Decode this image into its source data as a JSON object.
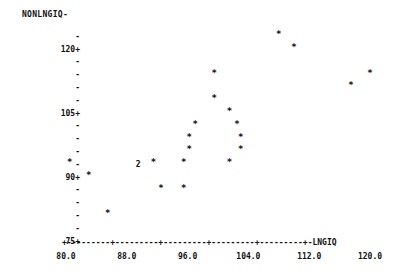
{
  "chart_data": {
    "type": "scatter",
    "title": "",
    "xlabel": "LNGIQ",
    "ylabel": "NONLNGIQ",
    "xlim": [
      78.0,
      124.0
    ],
    "ylim": [
      75,
      126
    ],
    "xticks": [
      "80.0",
      "88.0",
      "96.0",
      "104.0",
      "112.0",
      "120.0"
    ],
    "xtick_values": [
      80.0,
      88.0,
      96.0,
      104.0,
      120.0
    ],
    "yticks": [
      "120+",
      "105+",
      "90+",
      "75+"
    ],
    "ytick_values": [
      120,
      105,
      90,
      75
    ],
    "ytick_minor": "-",
    "grid": false,
    "legend": null,
    "marker": "*",
    "overlap_marker": "2",
    "points": [
      {
        "x": 80.5,
        "y": 93,
        "label": "*",
        "count": 1
      },
      {
        "x": 83.0,
        "y": 90,
        "label": "*",
        "count": 1
      },
      {
        "x": 85.5,
        "y": 81,
        "label": "*",
        "count": 1
      },
      {
        "x": 89.5,
        "y": 93,
        "label": "2",
        "count": 2
      },
      {
        "x": 91.5,
        "y": 93,
        "label": "*",
        "count": 1
      },
      {
        "x": 92.5,
        "y": 87,
        "label": "*",
        "count": 1
      },
      {
        "x": 95.5,
        "y": 93,
        "label": "*",
        "count": 1
      },
      {
        "x": 95.5,
        "y": 87,
        "label": "*",
        "count": 1
      },
      {
        "x": 96.2,
        "y": 96,
        "label": "*",
        "count": 1
      },
      {
        "x": 96.2,
        "y": 99,
        "label": "*",
        "count": 1
      },
      {
        "x": 97.0,
        "y": 102,
        "label": "*",
        "count": 1
      },
      {
        "x": 99.5,
        "y": 114,
        "label": "*",
        "count": 1
      },
      {
        "x": 99.5,
        "y": 108,
        "label": "*",
        "count": 1
      },
      {
        "x": 101.5,
        "y": 105,
        "label": "*",
        "count": 1
      },
      {
        "x": 101.5,
        "y": 93,
        "label": "*",
        "count": 1
      },
      {
        "x": 102.5,
        "y": 102,
        "label": "*",
        "count": 1
      },
      {
        "x": 103.0,
        "y": 99,
        "label": "*",
        "count": 1
      },
      {
        "x": 103.0,
        "y": 96,
        "label": "*",
        "count": 1
      },
      {
        "x": 108.0,
        "y": 123,
        "label": "*",
        "count": 1
      },
      {
        "x": 110.0,
        "y": 120,
        "label": "*",
        "count": 1
      },
      {
        "x": 117.5,
        "y": 111,
        "label": "*",
        "count": 1
      },
      {
        "x": 120.0,
        "y": 114,
        "label": "*",
        "count": 1
      }
    ]
  },
  "axis": {
    "x_axis_line": "+---------+---------+---------+---------+---------+-",
    "x_end_label": "LNGIQ"
  }
}
